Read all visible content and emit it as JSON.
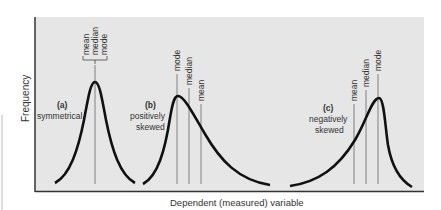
{
  "figure": {
    "y_axis_label": "Frequency",
    "x_axis_label": "Dependent (measured) variable",
    "colors": {
      "panel": "#e6e6e6",
      "curve": "#111111",
      "axis": "#333333",
      "text": "#333333"
    }
  },
  "panels": [
    {
      "id": "a",
      "tag": "(a)",
      "desc_line1": "symmetrical",
      "desc_line2": "",
      "markers": [
        "mean",
        "median",
        "mode"
      ],
      "grouped": true
    },
    {
      "id": "b",
      "tag": "(b)",
      "desc_line1": "positively",
      "desc_line2": "skewed",
      "markers": [
        "mode",
        "median",
        "mean"
      ],
      "grouped": false
    },
    {
      "id": "c",
      "tag": "(c)",
      "desc_line1": "negatively",
      "desc_line2": "skewed",
      "markers": [
        "mean",
        "median",
        "mode"
      ],
      "grouped": false
    }
  ]
}
